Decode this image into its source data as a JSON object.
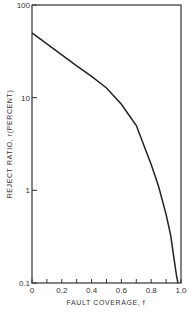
{
  "chart_data": {
    "type": "line",
    "title": "",
    "xlabel": "FAULT COVERAGE, f",
    "ylabel": "REJECT RATIO, r(PERCENT)",
    "xlim": [
      0,
      1.0
    ],
    "ylim": [
      0.1,
      100
    ],
    "yscale": "log",
    "grid": false,
    "legend": null,
    "x_ticks": [
      0,
      0.1,
      0.2,
      0.3,
      0.4,
      0.5,
      0.6,
      0.7,
      0.8,
      0.9,
      1.0
    ],
    "x_tick_labels": [
      "0",
      "0.2",
      "0.4",
      "0.6",
      "0.8",
      "1.0"
    ],
    "x_tick_label_values": [
      0,
      0.2,
      0.4,
      0.6,
      0.8,
      1.0
    ],
    "y_ticks": [
      0.1,
      1,
      10,
      100
    ],
    "y_tick_labels": [
      "0.1",
      "1",
      "10",
      "100"
    ],
    "series": [
      {
        "name": "reject ratio",
        "x": [
          0,
          0.1,
          0.2,
          0.3,
          0.4,
          0.5,
          0.6,
          0.7,
          0.8,
          0.85,
          0.9,
          0.93,
          0.95,
          0.97,
          0.98
        ],
        "y": [
          50,
          38,
          29,
          22,
          17,
          12.7,
          8.5,
          5,
          1.9,
          1.1,
          0.55,
          0.33,
          0.2,
          0.12,
          0.1
        ]
      }
    ]
  }
}
